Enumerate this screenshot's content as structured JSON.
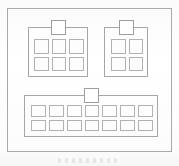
{
  "figure": {
    "background_color": "#fefefe",
    "line_color": "#a6a6a6",
    "cell_fill_color": "#fdfdfd"
  },
  "outer_frame": {
    "label": "enclosure-outline"
  },
  "modules": [
    {
      "id": "module-a",
      "label": "Top-left module",
      "tab_label": "connector-tab",
      "columns": 3,
      "rows": 2,
      "cell_count": 6
    },
    {
      "id": "module-b",
      "label": "Top-right module",
      "tab_label": "connector-tab",
      "columns": 2,
      "rows": 2,
      "cell_count": 4
    },
    {
      "id": "module-c",
      "label": "Bottom module",
      "tab_label": "connector-tab",
      "columns": 7,
      "rows": 2,
      "cell_count": 14
    }
  ],
  "artifact": {
    "label": "faint-scan-mark"
  }
}
